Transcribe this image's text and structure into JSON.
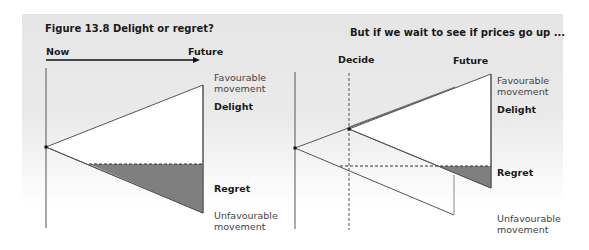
{
  "left_panel": {
    "title": "Figure 13.8 Delight or regret?",
    "axis_start_label": "Now",
    "axis_end_label": "Future",
    "favourable_line1": "Favourable",
    "favourable_line2": "movement",
    "delight_label": "Delight",
    "regret_label": "Regret",
    "unfavourable_line1": "Unfavourable",
    "unfavourable_line2": "movement"
  },
  "right_panel": {
    "title": "But if we wait to see if prices go up ...",
    "decide_label": "Decide",
    "future_label": "Future",
    "favourable_line1": "Favourable",
    "favourable_line2": "movement",
    "delight_label": "Delight",
    "regret_label": "Regret",
    "unfavourable_line1": "Unfavourable",
    "unfavourable_line2": "movement"
  },
  "colors": {
    "panel_background": "#e6e6e6",
    "line": "#555555",
    "regret_fill": "#7f7f7f",
    "delight_fill": "#ffffff"
  }
}
